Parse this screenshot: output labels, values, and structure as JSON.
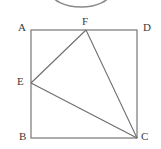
{
  "figure": {
    "canvas": {
      "width": 161,
      "height": 149
    },
    "background_color": "#ffffff",
    "stroke_color": "#6b6b6b",
    "label_color": "#3a3a3a",
    "stroke_width": 1,
    "square": {
      "name": "square-ABDC",
      "corners": [
        {
          "id": "A",
          "label": "A",
          "x": 31,
          "y": 30,
          "label_x": 18,
          "label_y": 22
        },
        {
          "id": "D",
          "label": "D",
          "x": 137,
          "y": 30,
          "label_x": 143,
          "label_y": 22
        },
        {
          "id": "C",
          "label": "C",
          "x": 137,
          "y": 138,
          "label_x": 141,
          "label_y": 131
        },
        {
          "id": "B",
          "label": "B",
          "x": 31,
          "y": 138,
          "label_x": 19,
          "label_y": 131
        }
      ],
      "side_length_px": 107
    },
    "points": [
      {
        "id": "E",
        "label": "E",
        "x": 31,
        "y": 83,
        "on_edge": "AB",
        "label_x": 17,
        "label_y": 76
      },
      {
        "id": "F",
        "label": "F",
        "x": 86,
        "y": 30,
        "on_edge": "AD",
        "label_x": 82,
        "label_y": 16
      }
    ],
    "triangle": {
      "name": "triangle-EFC",
      "vertices": [
        "E",
        "F",
        "C"
      ],
      "segments": [
        {
          "name": "segment-EF",
          "from": "E",
          "to": "F",
          "x1": 31,
          "y1": 83,
          "x2": 86,
          "y2": 30
        },
        {
          "name": "segment-FC",
          "from": "F",
          "to": "C",
          "x1": 86,
          "y1": 30,
          "x2": 137,
          "y2": 138
        },
        {
          "name": "segment-EC",
          "from": "E",
          "to": "C",
          "x1": 31,
          "y1": 83,
          "x2": 137,
          "y2": 138
        }
      ]
    },
    "partial_ellipse": {
      "name": "partial-ellipse-arc",
      "description": "bottom arc of an ellipse cropped by the top image edge",
      "center_x": 81,
      "center_y": -7,
      "radius_x": 29,
      "radius_y": 14,
      "stroke_color": "#8a8a8a"
    }
  }
}
